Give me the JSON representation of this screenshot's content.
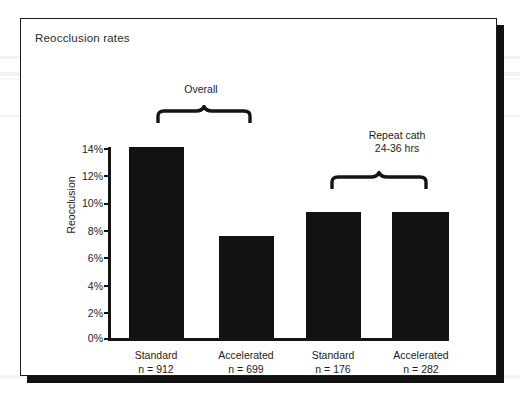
{
  "figure": {
    "title": "Reocclusion rates"
  },
  "chart_data": {
    "type": "bar",
    "title": "Reocclusion rates",
    "xlabel": "",
    "ylabel": "Reocclusion",
    "ylim": [
      0,
      14
    ],
    "grid": false,
    "legend": "none",
    "ytick_labels": [
      "14%",
      "12%",
      "10%",
      "8%",
      "6%",
      "4%",
      "2%",
      "0%"
    ],
    "ytick_values": [
      14,
      12,
      10,
      8,
      6,
      4,
      2,
      0
    ],
    "categories": [
      "Standard",
      "Accelerated",
      "Standard",
      "Accelerated"
    ],
    "category_sublabels": [
      "n = 912",
      "n = 699",
      "n = 176",
      "n = 282"
    ],
    "values": [
      14.1,
      7.5,
      9.3,
      9.3
    ],
    "value_unit": "%",
    "bar_color": "#121212",
    "annotations": [
      {
        "label": "Overall",
        "lines": [
          "Overall"
        ],
        "covers": [
          0,
          1
        ],
        "brace": "curly-brace-down"
      },
      {
        "label": "Repeat cath 24-36 hrs",
        "lines": [
          "Repeat cath",
          "24-36 hrs"
        ],
        "covers": [
          2,
          3
        ],
        "brace": "curly-brace-down"
      }
    ]
  },
  "colors": {
    "bar": "#121212",
    "axis": "#141414",
    "text": "#1c1c1c",
    "frame": "#1a1a1a",
    "shadow": "#121212",
    "background": "#ffffff"
  }
}
